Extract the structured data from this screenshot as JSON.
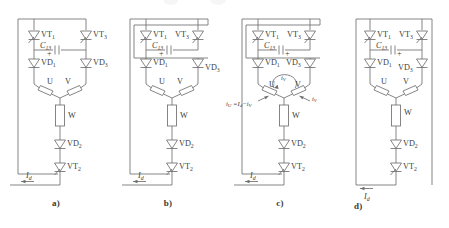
{
  "figure": {
    "panel_count": 4
  },
  "labels": {
    "vt1": "VT",
    "vt1_sub": "1",
    "vt2": "VT",
    "vt2_sub": "2",
    "vt3": "VT",
    "vt3_sub": "3",
    "vd1": "VD",
    "vd1_sub": "1",
    "vd2": "VD",
    "vd2_sub": "2",
    "vd3": "VD",
    "vd3_sub": "3",
    "cap": "C",
    "cap_sub": "13",
    "plus": "+",
    "winding_u": "U",
    "winding_v": "V",
    "winding_w": "W",
    "current_d": "I",
    "current_d_sub": "d",
    "current_u": "i",
    "current_u_sub": "U",
    "current_v": "i",
    "current_v_sub": "V",
    "equals": "=",
    "minus": "−"
  },
  "panels": [
    {
      "id": "a",
      "caption": "a)",
      "cap_polarity_side": "left",
      "vt3_label_side": "right",
      "vd3_label_side": "right",
      "current_annotations": false,
      "id_label_side": "left"
    },
    {
      "id": "b",
      "caption": "b)",
      "cap_polarity_side": "left",
      "vt3_label_side": "left",
      "vd3_label_side": "right",
      "current_annotations": false,
      "id_label_side": "left"
    },
    {
      "id": "c",
      "caption": "c)",
      "cap_polarity_side": "right",
      "vt3_label_side": "left",
      "vd3_label_side": "left",
      "current_annotations": true,
      "annotation_left": "i_U = I_d − i_V",
      "annotation_right": "i_V",
      "annotation_loop": "i_V",
      "id_label_side": "left"
    },
    {
      "id": "d",
      "caption": "d)",
      "cap_polarity_side": "right",
      "vt3_label_side": "left",
      "vd3_label_side": "left",
      "current_annotations": false,
      "id_label_side": "bottom-right"
    }
  ],
  "colors": {
    "line": "#6f6f6f",
    "text": "#3c3c3c",
    "background": "#ffffff"
  }
}
